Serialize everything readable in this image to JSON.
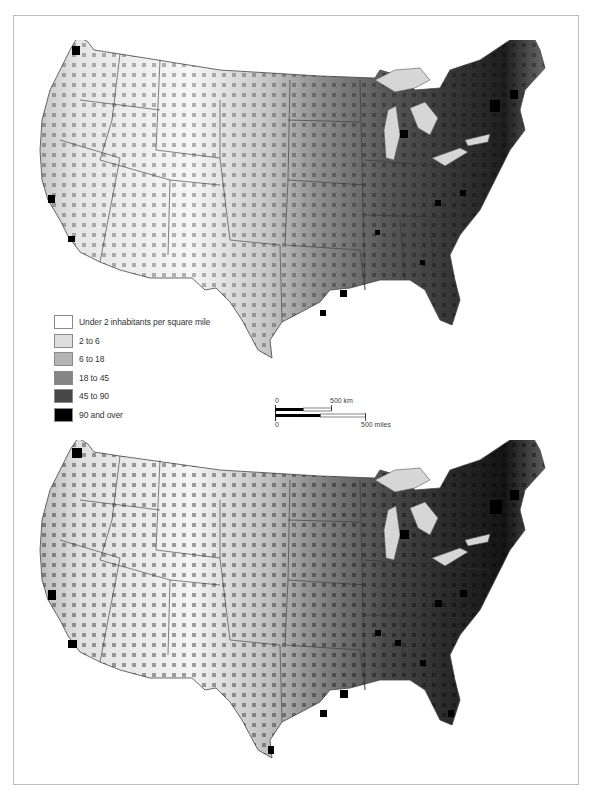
{
  "figure": {
    "maps": [
      {
        "position": "top",
        "region": "Contiguous United States"
      },
      {
        "position": "bottom",
        "region": "Contiguous United States"
      }
    ]
  },
  "legend": {
    "items": [
      {
        "label": "Under 2 inhabitants per square mile",
        "color": "#ffffff"
      },
      {
        "label": "2 to 6",
        "color": "#dedede"
      },
      {
        "label": "6 to 18",
        "color": "#b4b4b4"
      },
      {
        "label": "18 to 45",
        "color": "#858585"
      },
      {
        "label": "45 to 90",
        "color": "#474747"
      },
      {
        "label": "90 and over",
        "color": "#000000"
      }
    ]
  },
  "scale_bar": {
    "km": {
      "start": "0",
      "end": "500 km"
    },
    "miles": {
      "start": "0",
      "end": "500 miles"
    }
  },
  "colors": {
    "frame": "#bdbdbd",
    "borders": "#333333",
    "water": "#d6d6d6"
  }
}
